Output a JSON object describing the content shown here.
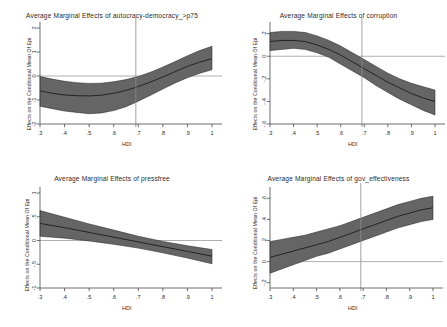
{
  "figure": {
    "background_color": "#ffffff",
    "band_color": "#656565",
    "line_color": "#1c1c1c",
    "axis_color": "#4a4a4a",
    "reference_line_color": "#8c8c8c"
  },
  "chart_data": [
    {
      "type": "line",
      "panel": "top-left",
      "title": "Average Marginal Effects of autocracy-democracy_>p75",
      "xlabel": "HDI",
      "ylabel": "Effects on the Conditional Mean Of Epi",
      "xlim": [
        0.3,
        1.0
      ],
      "ylim": [
        -2,
        2
      ],
      "xticks": [
        0.3,
        0.4,
        0.5,
        0.6,
        0.7,
        0.8,
        0.9,
        1.0
      ],
      "xticklabels": [
        ".3",
        ".4",
        ".5",
        ".6",
        ".7",
        ".8",
        ".9",
        "1"
      ],
      "yticks": [
        -2,
        -1,
        0,
        1,
        2
      ],
      "yticklabels": [
        "-2",
        "-1",
        "0",
        "1",
        "2"
      ],
      "grid": false,
      "legend": "none",
      "reference_lines": {
        "horizontal": 0,
        "vertical": 0.69
      },
      "x": [
        0.3,
        0.35,
        0.4,
        0.45,
        0.5,
        0.55,
        0.6,
        0.65,
        0.7,
        0.75,
        0.8,
        0.85,
        0.9,
        0.95,
        1.0
      ],
      "series": [
        {
          "name": "estimate",
          "values": [
            -0.62,
            -0.72,
            -0.79,
            -0.82,
            -0.83,
            -0.8,
            -0.72,
            -0.6,
            -0.44,
            -0.25,
            -0.04,
            0.18,
            0.4,
            0.58,
            0.72
          ]
        },
        {
          "name": "ci_upper",
          "values": [
            -0.02,
            -0.13,
            -0.22,
            -0.28,
            -0.31,
            -0.3,
            -0.24,
            -0.15,
            -0.02,
            0.16,
            0.37,
            0.6,
            0.84,
            1.06,
            1.24
          ]
        },
        {
          "name": "ci_lower",
          "values": [
            -1.26,
            -1.36,
            -1.46,
            -1.52,
            -1.57,
            -1.54,
            -1.44,
            -1.28,
            -1.05,
            -0.8,
            -0.54,
            -0.29,
            -0.07,
            0.11,
            0.26
          ]
        }
      ]
    },
    {
      "type": "line",
      "panel": "top-right",
      "title": "Average Marginal Effects of corruption",
      "xlabel": "HDI",
      "ylabel": "Effects on the Conditional Mean Of Epi",
      "xlim": [
        0.3,
        1.0
      ],
      "ylim": [
        -0.6,
        0.25
      ],
      "xticks": [
        0.3,
        0.4,
        0.5,
        0.6,
        0.7,
        0.8,
        0.9,
        1.0
      ],
      "xticklabels": [
        ".3",
        ".4",
        ".5",
        ".6",
        ".7",
        ".8",
        ".9",
        "1"
      ],
      "yticks": [
        -0.6,
        -0.4,
        -0.2,
        0,
        0.2
      ],
      "yticklabels": [
        "-.6",
        "-.4",
        "-.2",
        "0",
        ".2"
      ],
      "grid": false,
      "legend": "none",
      "reference_lines": {
        "horizontal": 0,
        "vertical": 0.69
      },
      "x": [
        0.3,
        0.35,
        0.4,
        0.45,
        0.5,
        0.55,
        0.6,
        0.65,
        0.7,
        0.75,
        0.8,
        0.85,
        0.9,
        0.95,
        1.0
      ],
      "series": [
        {
          "name": "estimate",
          "values": [
            0.13,
            0.14,
            0.14,
            0.13,
            0.1,
            0.06,
            0.01,
            -0.05,
            -0.11,
            -0.17,
            -0.23,
            -0.28,
            -0.33,
            -0.37,
            -0.4
          ]
        },
        {
          "name": "ci_upper",
          "values": [
            0.21,
            0.22,
            0.22,
            0.21,
            0.18,
            0.14,
            0.09,
            0.03,
            -0.03,
            -0.09,
            -0.15,
            -0.2,
            -0.24,
            -0.27,
            -0.3
          ]
        },
        {
          "name": "ci_lower",
          "values": [
            0.05,
            0.06,
            0.07,
            0.06,
            0.03,
            -0.01,
            -0.07,
            -0.13,
            -0.19,
            -0.26,
            -0.32,
            -0.38,
            -0.43,
            -0.48,
            -0.52
          ]
        }
      ]
    },
    {
      "type": "line",
      "panel": "bottom-left",
      "title": "Average Marginal Effects of pressfree",
      "xlabel": "HDI",
      "ylabel": "Effects on the Conditional Mean Of Epi",
      "xlim": [
        0.3,
        1.0
      ],
      "ylim": [
        -1,
        1
      ],
      "xticks": [
        0.3,
        0.4,
        0.5,
        0.6,
        0.7,
        0.8,
        0.9,
        1.0
      ],
      "xticklabels": [
        ".3",
        ".4",
        ".5",
        ".6",
        ".7",
        ".8",
        ".9",
        "1"
      ],
      "yticks": [
        -1,
        -0.5,
        0,
        0.5,
        1
      ],
      "yticklabels": [
        "-1",
        "-.5",
        "0",
        ".5",
        "1"
      ],
      "grid": false,
      "legend": "none",
      "reference_lines": {
        "horizontal": 0,
        "vertical": null
      },
      "x": [
        0.3,
        0.4,
        0.5,
        0.6,
        0.7,
        0.8,
        0.9,
        1.0
      ],
      "series": [
        {
          "name": "estimate",
          "values": [
            0.36,
            0.27,
            0.17,
            0.07,
            -0.03,
            -0.13,
            -0.23,
            -0.33
          ]
        },
        {
          "name": "ci_upper",
          "values": [
            0.63,
            0.49,
            0.35,
            0.22,
            0.09,
            -0.02,
            -0.11,
            -0.19
          ]
        },
        {
          "name": "ci_lower",
          "values": [
            0.09,
            0.05,
            -0.01,
            -0.08,
            -0.16,
            -0.26,
            -0.37,
            -0.49
          ]
        }
      ]
    },
    {
      "type": "line",
      "panel": "bottom-right",
      "title": "Average Marginal Effects of gov_effectiveness",
      "xlabel": "HDI",
      "ylabel": "Effects on the Conditional Mean Of Epi",
      "xlim": [
        0.3,
        1.0
      ],
      "ylim": [
        -0.25,
        0.65
      ],
      "xticks": [
        0.3,
        0.4,
        0.5,
        0.6,
        0.7,
        0.8,
        0.9,
        1.0
      ],
      "xticklabels": [
        ".3",
        ".4",
        ".5",
        ".6",
        ".7",
        ".8",
        ".9",
        "1"
      ],
      "yticks": [
        -0.2,
        0,
        0.2,
        0.4,
        0.6
      ],
      "yticklabels": [
        "-.2",
        "0",
        ".2",
        ".4",
        ".6"
      ],
      "grid": false,
      "legend": "none",
      "reference_lines": {
        "horizontal": 0,
        "vertical": 0.69
      },
      "x": [
        0.3,
        0.35,
        0.4,
        0.45,
        0.5,
        0.55,
        0.6,
        0.65,
        0.7,
        0.75,
        0.8,
        0.85,
        0.9,
        0.95,
        1.0
      ],
      "series": [
        {
          "name": "estimate",
          "values": [
            0.04,
            0.07,
            0.1,
            0.13,
            0.16,
            0.19,
            0.23,
            0.27,
            0.31,
            0.35,
            0.39,
            0.43,
            0.46,
            0.49,
            0.51
          ]
        },
        {
          "name": "ci_upper",
          "values": [
            0.19,
            0.21,
            0.23,
            0.25,
            0.28,
            0.31,
            0.34,
            0.38,
            0.42,
            0.46,
            0.5,
            0.54,
            0.57,
            0.6,
            0.62
          ]
        },
        {
          "name": "ci_lower",
          "values": [
            -0.11,
            -0.07,
            -0.03,
            0.01,
            0.05,
            0.08,
            0.12,
            0.16,
            0.2,
            0.24,
            0.28,
            0.32,
            0.35,
            0.38,
            0.4
          ]
        }
      ]
    }
  ]
}
